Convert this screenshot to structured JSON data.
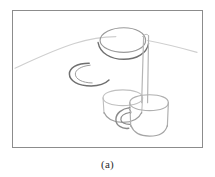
{
  "figure": {
    "caption": "(a)",
    "frame": {
      "x": 12,
      "y": 10,
      "width": 191,
      "height": 138,
      "border_color": "#8c8c8c",
      "background_color": "#ffffff"
    },
    "canvas": {
      "viewbox_width": 191,
      "viewbox_height": 138
    },
    "medium": "pencil-line-drawing",
    "stroke_colors": {
      "faint": "#d6d6d6",
      "light": "#c2c2c2",
      "medium": "#a8a8a8",
      "dark": "#7b7b7b",
      "darkest": "#5f5f5f"
    },
    "strokes": [
      {
        "name": "horizon-line-left",
        "role": "background-horizon",
        "color": "#cfcfcf",
        "width": 1.1,
        "d": "M 2 58 C 20 50 40 40 62 33 C 78 28 92 26 104 26"
      },
      {
        "name": "horizon-line-right",
        "role": "background-horizon",
        "color": "#cfcfcf",
        "width": 1.1,
        "d": "M 136 30 C 152 33 168 37 186 42"
      },
      {
        "name": "top-cylinder-rim-ellipse",
        "role": "object-rim",
        "color": "#9a9a9a",
        "width": 1.2,
        "d": "M 88 30 C 88 22 100 17 112 17 C 124 17 134 22 134 30 C 134 37 124 42 112 42 C 100 42 88 37 88 30 Z"
      },
      {
        "name": "top-cylinder-lower-arc",
        "role": "object-body",
        "color": "#6f6f6f",
        "width": 1.4,
        "d": "M 86 32 C 88 43 99 49 112 49 C 125 49 135 43 137 33"
      },
      {
        "name": "mug-handle-c-arc",
        "role": "object-handle",
        "color": "#6f6f6f",
        "width": 1.5,
        "d": "M 77 53 C 64 53 57 58 57 64 C 57 71 66 76 79 76 C 88 76 94 73 97 70"
      },
      {
        "name": "mug-handle-c-inner",
        "role": "object-handle",
        "color": "#9a9a9a",
        "width": 1.0,
        "d": "M 78 55 C 68 56 63 60 63 64 C 63 69 70 73 80 73"
      },
      {
        "name": "vertical-stem-left",
        "role": "object-edge",
        "color": "#b5b5b5",
        "width": 1.2,
        "d": "M 132 26 L 130 93"
      },
      {
        "name": "vertical-stem-right",
        "role": "object-edge",
        "color": "#b5b5b5",
        "width": 1.2,
        "d": "M 137 25 L 136 93"
      },
      {
        "name": "stem-top-cap",
        "role": "object-edge",
        "color": "#b5b5b5",
        "width": 1.0,
        "d": "M 131 26 C 133 23 136 23 137 25"
      },
      {
        "name": "rear-cup-rim",
        "role": "object-rim",
        "color": "#c0c0c0",
        "width": 1.1,
        "d": "M 91 88 C 91 83 100 80 111 80 C 122 80 131 83 131 88 C 131 93 122 96 111 96 C 100 96 91 93 91 88 Z"
      },
      {
        "name": "rear-cup-left-wall",
        "role": "object-edge",
        "color": "#bdbdbd",
        "width": 1.1,
        "d": "M 91 88 L 92 104"
      },
      {
        "name": "rear-cup-right-wall",
        "role": "object-edge",
        "color": "#bdbdbd",
        "width": 1.1,
        "d": "M 131 88 L 130 104"
      },
      {
        "name": "rear-cup-base-arc",
        "role": "object-base",
        "color": "#9e9e9e",
        "width": 1.2,
        "d": "M 92 103 C 95 110 102 113 111 113 C 120 113 127 110 130 103"
      },
      {
        "name": "front-cup-rim",
        "role": "object-rim",
        "color": "#b0b0b0",
        "width": 1.2,
        "d": "M 118 93 C 118 88 127 85 138 85 C 149 85 157 88 157 93 C 157 98 149 101 138 101 C 127 101 118 98 118 93 Z"
      },
      {
        "name": "front-cup-left-wall",
        "role": "object-edge",
        "color": "#b0b0b0",
        "width": 1.2,
        "d": "M 118 93 L 119 117"
      },
      {
        "name": "front-cup-right-wall",
        "role": "object-edge",
        "color": "#b0b0b0",
        "width": 1.2,
        "d": "M 157 93 L 156 117"
      },
      {
        "name": "front-cup-base-arc",
        "role": "object-base",
        "color": "#a5a5a5",
        "width": 1.2,
        "d": "M 119 116 C 122 124 130 127 138 127 C 146 127 154 124 156 116"
      },
      {
        "name": "front-cup-handle-outer",
        "role": "object-handle",
        "color": "#8a8a8a",
        "width": 1.4,
        "d": "M 118 98 C 110 99 104 104 104 110 C 104 116 110 120 117 119"
      },
      {
        "name": "front-cup-handle-inner",
        "role": "object-handle",
        "color": "#8a8a8a",
        "width": 1.2,
        "d": "M 118 103 C 112 104 109 107 109 110 C 109 113 113 115 118 115"
      },
      {
        "name": "front-cup-handle-tick",
        "role": "object-handle",
        "color": "#9a9a9a",
        "width": 1.0,
        "d": "M 117 99 C 119 101 120 103 119 104"
      }
    ]
  }
}
